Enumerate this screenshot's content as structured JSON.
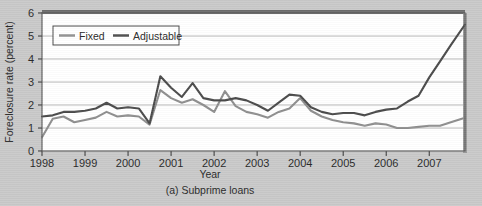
{
  "figure": {
    "caption": "(a) Subprime loans",
    "background_color": "#c9c9c9",
    "plot_background_color": "#ffffff",
    "frame_color": "#5f5f5f",
    "gridline_color": "#b8b8b8"
  },
  "legend": {
    "position": "top-left-inside",
    "entries": [
      {
        "label": "Fixed",
        "color": "#8e8e8e"
      },
      {
        "label": "Adjustable",
        "color": "#4a4a4a"
      }
    ]
  },
  "chart_data": {
    "type": "line",
    "title": "",
    "subtitle": "",
    "caption": "(a) Subprime loans",
    "xlabel": "Year",
    "ylabel": "Foreclosure rate (percent)",
    "xlim": [
      1998.0,
      2007.83
    ],
    "ylim": [
      0,
      6
    ],
    "yticks": [
      0,
      1,
      2,
      3,
      4,
      5,
      6
    ],
    "xticks": [
      1998,
      1999,
      2000,
      2001,
      2002,
      2003,
      2004,
      2005,
      2006,
      2007
    ],
    "xtick_labels": [
      "1998",
      "1999",
      "2000",
      "2001",
      "2002",
      "2003",
      "2004",
      "2005",
      "2006",
      "2007"
    ],
    "ytick_labels": [
      "0",
      "1",
      "2",
      "3",
      "4",
      "5",
      "6"
    ],
    "grid": true,
    "grid_axis": "y",
    "legend_position": "upper left",
    "x": [
      1998.0,
      1998.25,
      1998.5,
      1998.75,
      1999.0,
      1999.25,
      1999.5,
      1999.75,
      2000.0,
      2000.25,
      2000.5,
      2000.75,
      2001.0,
      2001.25,
      2001.5,
      2001.75,
      2002.0,
      2002.25,
      2002.5,
      2002.75,
      2003.0,
      2003.25,
      2003.5,
      2003.75,
      2004.0,
      2004.25,
      2004.5,
      2004.75,
      2005.0,
      2005.25,
      2005.5,
      2005.75,
      2006.0,
      2006.25,
      2006.5,
      2006.75,
      2007.0,
      2007.25,
      2007.5,
      2007.83
    ],
    "series": [
      {
        "name": "Fixed",
        "color": "#8e8e8e",
        "values": [
          0.6,
          1.4,
          1.5,
          1.25,
          1.35,
          1.45,
          1.7,
          1.5,
          1.55,
          1.5,
          1.15,
          2.65,
          2.3,
          2.1,
          2.25,
          2.0,
          1.7,
          2.6,
          1.95,
          1.7,
          1.6,
          1.45,
          1.7,
          1.85,
          2.3,
          1.75,
          1.5,
          1.35,
          1.25,
          1.2,
          1.1,
          1.2,
          1.15,
          1.0,
          1.0,
          1.05,
          1.1,
          1.1,
          1.25,
          1.45
        ]
      },
      {
        "name": "Adjustable",
        "color": "#4a4a4a",
        "values": [
          1.5,
          1.55,
          1.7,
          1.7,
          1.75,
          1.85,
          2.1,
          1.85,
          1.9,
          1.85,
          1.2,
          3.25,
          2.75,
          2.35,
          2.95,
          2.3,
          2.2,
          2.2,
          2.3,
          2.2,
          2.0,
          1.75,
          2.1,
          2.45,
          2.4,
          1.9,
          1.7,
          1.6,
          1.65,
          1.65,
          1.55,
          1.7,
          1.8,
          1.85,
          2.15,
          2.4,
          3.2,
          3.9,
          4.6,
          5.5
        ]
      }
    ]
  }
}
